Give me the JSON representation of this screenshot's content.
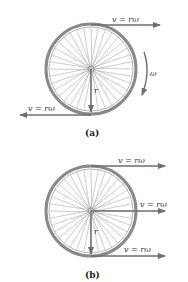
{
  "figure_a": {
    "caption": "(a)",
    "top_velocity_label": "v = rω",
    "bottom_velocity_label": "v = rω",
    "angular_label": "ω",
    "radius_label": "r",
    "rim_color": "#8a8a8a",
    "arrow_color": "#6e6e6e"
  },
  "figure_b": {
    "caption": "(b)",
    "top_velocity_label": "v = rω",
    "middle_velocity_label": "v = rω",
    "bottom_velocity_label": "v = rω",
    "radius_label": "r",
    "rim_color": "#8a8a8a",
    "arrow_color": "#6e6e6e"
  },
  "spoke_count": 36
}
